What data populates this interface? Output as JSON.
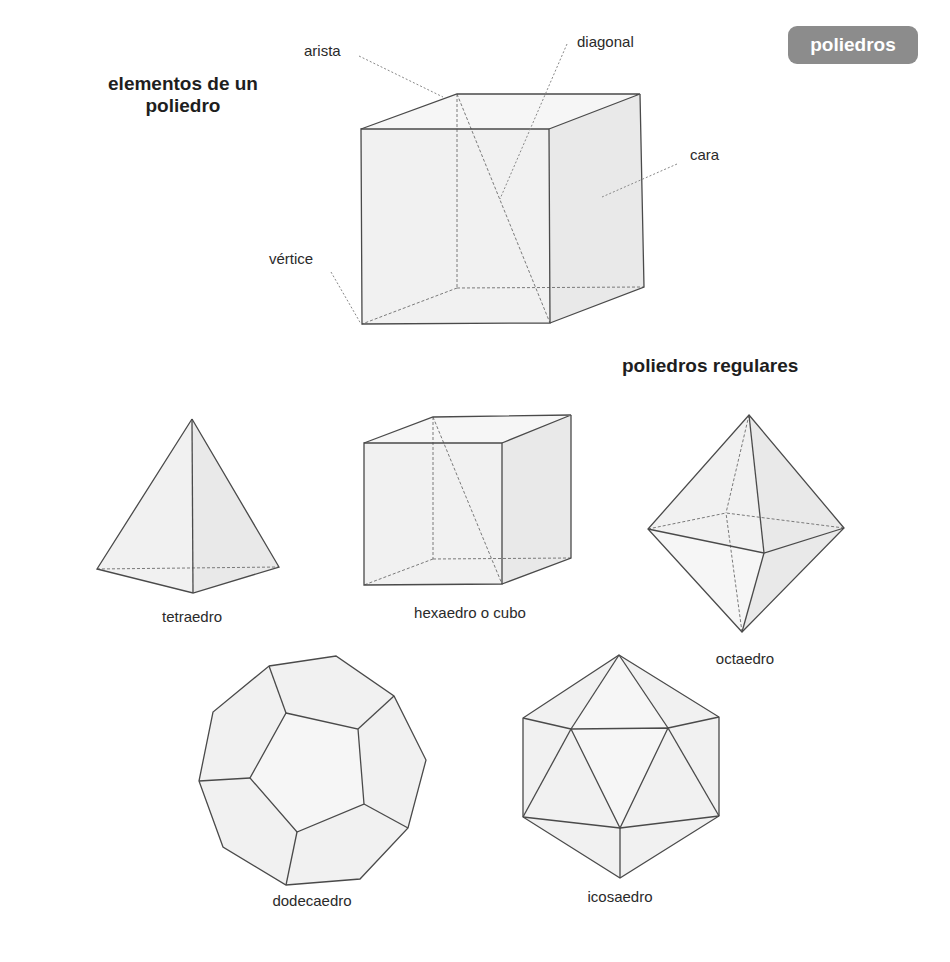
{
  "badge": {
    "label": "poliedros",
    "color": "#8c8c8c"
  },
  "section_elements": {
    "title": "elementos de un\npoliedro",
    "labels": {
      "arista": "arista",
      "diagonal": "diagonal",
      "cara": "cara",
      "vertice": "vértice"
    }
  },
  "section_regular": {
    "title": "poliedros regulares",
    "solids": [
      {
        "id": "tetraedro",
        "label": "tetraedro"
      },
      {
        "id": "hexaedro",
        "label": "hexaedro o cubo"
      },
      {
        "id": "octaedro",
        "label": "octaedro"
      },
      {
        "id": "dodecaedro",
        "label": "dodecaedro"
      },
      {
        "id": "icosaedro",
        "label": "icosaedro"
      }
    ]
  }
}
